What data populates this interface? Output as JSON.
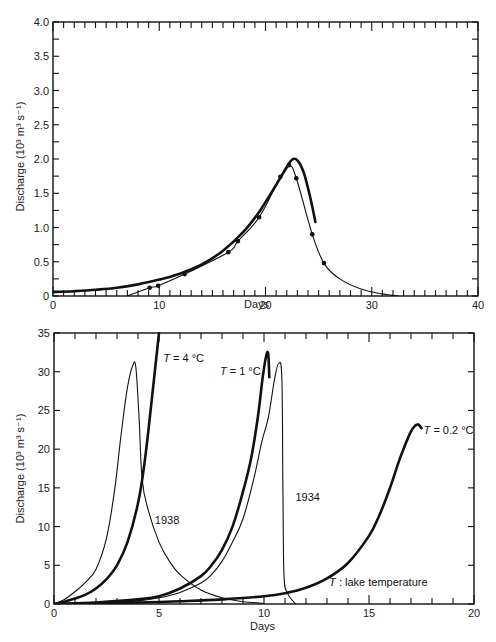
{
  "chart_data": [
    {
      "type": "line",
      "title": "",
      "xlabel": "Days",
      "ylabel": "Discharge (10³ m³ s⁻¹)",
      "xlim": [
        0,
        40
      ],
      "ylim": [
        0,
        4.0
      ],
      "xticks": [
        0,
        10,
        20,
        30,
        40
      ],
      "xtick_labels": [
        "0",
        "10",
        "20",
        "30",
        "40"
      ],
      "yticks": [
        0,
        0.5,
        1.0,
        1.5,
        2.0,
        2.5,
        3.0,
        3.5,
        4.0
      ],
      "ytick_labels": [
        "0",
        "0.5",
        "1.0",
        "1.5",
        "2.0",
        "2.5",
        "3.0",
        "3.5",
        "4.0"
      ],
      "grid": false,
      "legend": null,
      "frame": {
        "left": 53,
        "right": 478,
        "top": 22,
        "bottom": 296
      },
      "series": [
        {
          "name": "computed (thick)",
          "style": "thick",
          "markers": false,
          "x": [
            0,
            2,
            4,
            6,
            8,
            10,
            12,
            14,
            16,
            18,
            19.5,
            21,
            22,
            22.5,
            23,
            23.6,
            24.2,
            24.7
          ],
          "y": [
            0.06,
            0.07,
            0.09,
            0.12,
            0.17,
            0.24,
            0.33,
            0.46,
            0.66,
            0.95,
            1.25,
            1.62,
            1.88,
            1.99,
            1.98,
            1.8,
            1.45,
            1.08
          ]
        },
        {
          "name": "observed (thin, dots)",
          "style": "thin",
          "markers": true,
          "x": [
            7,
            9.1,
            9.9,
            12.4,
            16.5,
            17.4,
            19.4,
            21.4,
            22.2,
            22.9,
            24.4,
            25.5,
            27,
            29,
            31,
            32.5
          ],
          "y": [
            0.0,
            0.12,
            0.15,
            0.32,
            0.64,
            0.8,
            1.15,
            1.74,
            1.91,
            1.72,
            0.9,
            0.48,
            0.25,
            0.1,
            0.03,
            0.0
          ],
          "marker_indices": [
            1,
            2,
            3,
            4,
            5,
            6,
            7,
            8,
            9,
            10,
            11
          ]
        }
      ],
      "annotations": []
    },
    {
      "type": "line",
      "title": "",
      "xlabel": "Days",
      "ylabel": "Discharge (10³ m³ s⁻¹)",
      "xlim": [
        0,
        20
      ],
      "ylim": [
        0,
        35
      ],
      "xticks": [
        0,
        5,
        10,
        15,
        20
      ],
      "xtick_labels": [
        "0",
        "5",
        "10",
        "15",
        "20"
      ],
      "yticks": [
        0,
        5,
        10,
        15,
        20,
        25,
        30,
        35
      ],
      "ytick_labels": [
        "0",
        "5",
        "10",
        "15",
        "20",
        "25",
        "30",
        "35"
      ],
      "grid": false,
      "legend": null,
      "frame": {
        "left": 54,
        "right": 474,
        "top": 333,
        "bottom": 604
      },
      "series": [
        {
          "name": "1938",
          "style": "thin",
          "x": [
            0,
            0.5,
            1,
            1.5,
            2,
            2.5,
            2.9,
            3.2,
            3.5,
            3.75,
            3.9,
            4.05,
            4.2,
            4.5,
            5,
            5.5,
            6,
            7,
            8,
            9,
            10
          ],
          "y": [
            0,
            0.6,
            1.6,
            2.8,
            4.5,
            8.5,
            15,
            22,
            28,
            30.8,
            30.5,
            24,
            16,
            12,
            8,
            5.5,
            3.8,
            1.8,
            0.8,
            0.3,
            0.1
          ]
        },
        {
          "name": "T = 4 °C",
          "style": "thick",
          "x": [
            0,
            0.5,
            1,
            1.5,
            2,
            2.5,
            3,
            3.5,
            4,
            4.3,
            4.6,
            5.0
          ],
          "y": [
            0,
            0.3,
            0.7,
            1.2,
            2.0,
            3.2,
            5.0,
            8.0,
            13.0,
            18.0,
            25.0,
            35.0
          ]
        },
        {
          "name": "T = 1 °C",
          "style": "thick",
          "x": [
            0,
            2,
            4,
            5,
            6,
            7,
            7.5,
            8,
            8.5,
            9,
            9.4,
            9.7,
            9.95,
            10.1,
            10.2,
            10.25
          ],
          "y": [
            0,
            0.2,
            0.6,
            1.0,
            2.0,
            3.6,
            5.0,
            7.0,
            10.0,
            14.5,
            19.0,
            24.0,
            29.5,
            32.0,
            32.3,
            29.3
          ]
        },
        {
          "name": "1934",
          "style": "thin",
          "x": [
            0,
            2,
            4,
            5,
            6,
            7,
            7.5,
            8,
            8.5,
            9,
            9.5,
            9.9,
            10.2,
            10.5,
            10.7,
            10.85,
            10.9,
            10.95,
            11.1,
            11.5
          ],
          "y": [
            0,
            0.1,
            0.4,
            0.8,
            1.5,
            2.7,
            3.8,
            5.5,
            8.0,
            11.0,
            16.0,
            21.0,
            24.0,
            29.0,
            31.1,
            29.0,
            15.0,
            4.0,
            1.5,
            0
          ]
        },
        {
          "name": "T = 0.2 °C",
          "style": "thick",
          "x": [
            0,
            2,
            4,
            6,
            8,
            10,
            11,
            12,
            13,
            14,
            15,
            15.5,
            16,
            16.5,
            17,
            17.3,
            17.5
          ],
          "y": [
            0,
            0.1,
            0.2,
            0.35,
            0.6,
            1.0,
            1.4,
            2.1,
            3.3,
            5.3,
            8.8,
            11.5,
            15.0,
            19.0,
            22.3,
            23.2,
            22.7
          ]
        }
      ],
      "annotations": [
        {
          "text_italic": "T",
          "text": " = 4 °C",
          "x": 5.2,
          "y": 31.3
        },
        {
          "text_italic": "T",
          "text": " = 1 °C",
          "x": 7.9,
          "y": 29.6
        },
        {
          "text_italic": "",
          "text": "1938",
          "x": 4.8,
          "y": 10.3
        },
        {
          "text_italic": "",
          "text": "1934",
          "x": 11.5,
          "y": 13.3
        },
        {
          "text_italic": "T",
          "text": " = 0.2 °C",
          "x": 17.6,
          "y": 22.0
        },
        {
          "text_italic": "T",
          "text": " : lake temperature",
          "x": 13.1,
          "y": 2.3
        }
      ]
    }
  ],
  "labels": {
    "top_xlabel": "Days",
    "top_ylabel": "Discharge (10³ m³ s⁻¹)",
    "bottom_xlabel": "Days",
    "bottom_ylabel": "Discharge (10³ m³ s⁻¹)"
  },
  "colors": {
    "ink": "#111111",
    "background": "#ffffff"
  }
}
